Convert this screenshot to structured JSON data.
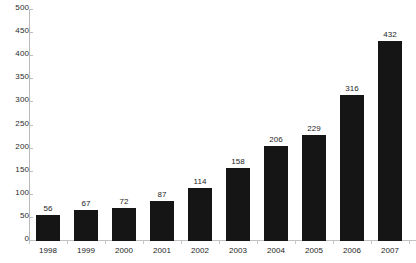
{
  "chart_data": {
    "type": "bar",
    "title": "",
    "subtitle": "",
    "xlabel": "",
    "ylabel": "",
    "categories": [
      "1998",
      "1999",
      "2000",
      "2001",
      "2002",
      "2003",
      "2004",
      "2005",
      "2006",
      "2007"
    ],
    "values": [
      56,
      67,
      72,
      87,
      114,
      158,
      206,
      229,
      316,
      432
    ],
    "data_labels": [
      "56",
      "67",
      "72",
      "87",
      "114",
      "158",
      "206",
      "229",
      "316",
      "432"
    ],
    "ylim": [
      0,
      500
    ],
    "ytick_values": [
      0,
      50,
      100,
      150,
      200,
      250,
      300,
      350,
      400,
      450,
      500
    ],
    "ytick_labels": [
      "0",
      "50",
      "100",
      "150",
      "200",
      "250",
      "300",
      "350",
      "400",
      "450",
      "500"
    ],
    "grid": false,
    "legend": null,
    "legend_position": "none",
    "bar_color": "#151515",
    "axis_color": "#bdbdbd",
    "text_color": "#1d1d1d",
    "background_color": "#ffffff"
  }
}
